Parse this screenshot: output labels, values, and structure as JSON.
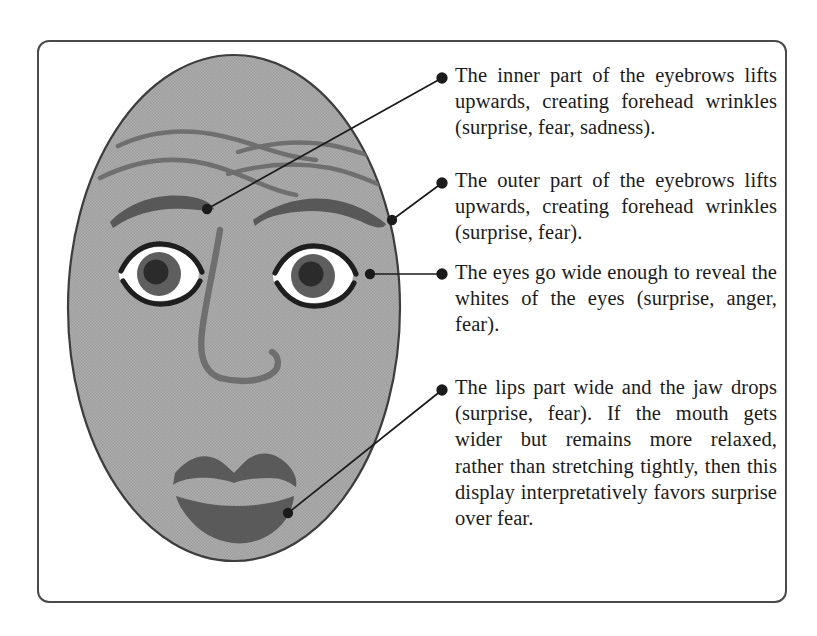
{
  "figure": {
    "kind": "annotated-facial-expression-diagram",
    "frame_border_color": "#4a4a4a",
    "face_fill_color": "#a9a9a9",
    "face_outline_color": "#3d3d3d",
    "feature_dark_color": "#4d4d4d",
    "eye_outline_color": "#1e1e1e",
    "sclera_color": "#ffffff",
    "iris_color": "#5e5e5e",
    "pupil_color": "#2b2b2b",
    "leader_line_color": "#1b1b1b",
    "text_color": "#1b1b1b"
  },
  "annotations": [
    {
      "id": "inner-eyebrows",
      "bullet_label": "•",
      "text": "The inner part of the eyebrows lifts upwards, creating forehead wrinkles (surprise, fear, sadness).",
      "emotions": [
        "surprise",
        "fear",
        "sadness"
      ],
      "target": "inner-eyebrow",
      "bullet_point": {
        "x": 442,
        "y": 78
      },
      "anchor_point": {
        "x": 207,
        "y": 209
      }
    },
    {
      "id": "outer-eyebrows",
      "bullet_label": "•",
      "text": "The outer part of the eyebrows lifts upwards, creating forehead wrinkles (surprise, fear).",
      "emotions": [
        "surprise",
        "fear"
      ],
      "target": "outer-eyebrow",
      "bullet_point": {
        "x": 442,
        "y": 183
      },
      "anchor_point": {
        "x": 392,
        "y": 220
      }
    },
    {
      "id": "wide-eyes",
      "bullet_label": "•",
      "text": "The eyes go wide enough to reveal the whites of the eyes (surprise, anger, fear).",
      "emotions": [
        "surprise",
        "anger",
        "fear"
      ],
      "target": "right-eye",
      "bullet_point": {
        "x": 442,
        "y": 274
      },
      "anchor_point": {
        "x": 370,
        "y": 274
      }
    },
    {
      "id": "parted-lips",
      "bullet_label": "•",
      "text": "The lips part wide and the jaw drops (surprise, fear). If the mouth gets wider but remains more relaxed, rather than stretching tightly, then this display interpretatively favors surprise over fear.",
      "emotions": [
        "surprise",
        "fear"
      ],
      "target": "mouth",
      "bullet_point": {
        "x": 442,
        "y": 390
      },
      "anchor_point": {
        "x": 288,
        "y": 513
      }
    }
  ],
  "face_features": {
    "forehead_wrinkles_count": 4,
    "eyebrows": [
      "left-eyebrow",
      "right-eyebrow"
    ],
    "eyes": [
      "left-eye",
      "right-eye"
    ],
    "nose": "nose-bridge-and-nostril",
    "mouth": "open-mouth-upper-and-lower-lip"
  }
}
